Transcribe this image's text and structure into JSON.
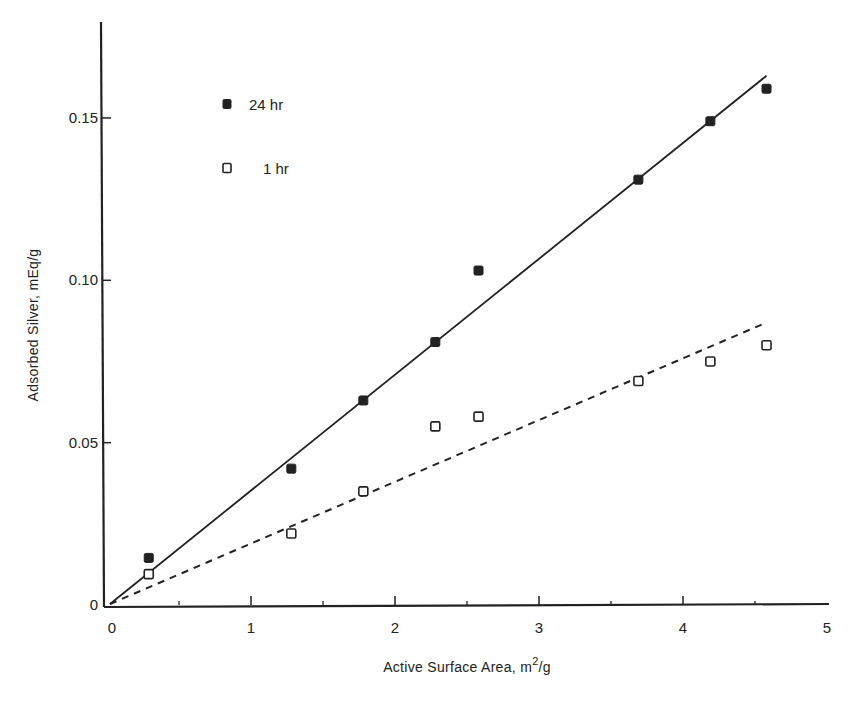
{
  "chart_data": {
    "type": "scatter",
    "title": "",
    "xlabel": "Active Surface Area, m²/g",
    "xlabel_parts": {
      "main": "Active Surface Area, m",
      "sup": "2",
      "tail": "/g"
    },
    "ylabel": "Adsorbed Silver, mEq/g",
    "xlim": [
      0,
      5
    ],
    "ylim": [
      0,
      0.18
    ],
    "x_ticks": [
      0,
      1,
      2,
      3,
      4,
      5
    ],
    "x_minor_ticks": [
      0.5,
      1.5,
      2.5,
      3.5,
      4.5
    ],
    "y_ticks": [
      0,
      0.05,
      0.1,
      0.15
    ],
    "x_tick_labels": [
      "0",
      "1",
      "2",
      "3",
      "4",
      "5"
    ],
    "y_tick_labels": [
      "0",
      "0.05",
      "0.10",
      "0.15"
    ],
    "grid": false,
    "legend_position": "upper-left",
    "series": [
      {
        "name": "24 hr",
        "marker": "filled-square",
        "x": [
          0.29,
          1.28,
          1.78,
          2.28,
          2.58,
          3.69,
          4.19,
          4.58
        ],
        "y": [
          0.0145,
          0.042,
          0.063,
          0.081,
          0.103,
          0.131,
          0.149,
          0.159
        ],
        "fit_line": {
          "style": "solid",
          "x": [
            0,
            4.58
          ],
          "y": [
            0,
            0.163
          ]
        }
      },
      {
        "name": "1 hr",
        "marker": "open-square",
        "x": [
          0.29,
          1.28,
          1.78,
          2.28,
          2.58,
          3.69,
          4.19,
          4.58
        ],
        "y": [
          0.0095,
          0.022,
          0.035,
          0.055,
          0.058,
          0.069,
          0.075,
          0.08
        ],
        "fit_line": {
          "style": "dashed",
          "x": [
            0,
            4.58
          ],
          "y": [
            0,
            0.087
          ]
        }
      }
    ]
  },
  "legend": [
    {
      "label": "24 hr",
      "marker": "filled-square"
    },
    {
      "label": "1 hr",
      "marker": "open-square"
    }
  ],
  "colors": {
    "ink": "#222222",
    "background": "#ffffff"
  }
}
